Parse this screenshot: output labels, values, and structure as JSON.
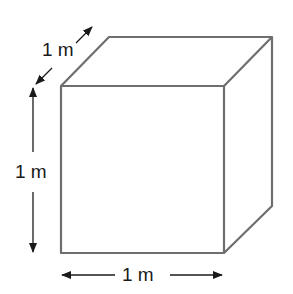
{
  "diagram": {
    "shape": "cube",
    "colors": {
      "edge": "#6e6e6e",
      "arrow": "#1a1a1a",
      "background": "#ffffff"
    },
    "dimensions": {
      "depth": {
        "label": "1 m"
      },
      "height": {
        "label": "1 m"
      },
      "width": {
        "label": "1 m"
      }
    }
  }
}
